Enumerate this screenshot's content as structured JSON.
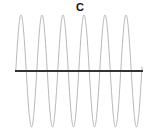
{
  "figure": {
    "label": "C",
    "colors": {
      "wave": "#b8b8b8",
      "baseline": "#333333",
      "label": "#111111"
    }
  },
  "chart_data": {
    "type": "line",
    "title": "C",
    "cycles": 6,
    "wave": {
      "center_y_px": 71,
      "amplitude_px": 56,
      "period_px": 21,
      "start_x_px": 15.75,
      "end_x_px": 142,
      "peaks_x_px": [
        21,
        42,
        63,
        84,
        105,
        126
      ],
      "troughs_x_px": [
        31.5,
        52.5,
        73.5,
        94.5,
        115.5,
        136.5
      ]
    },
    "baseline": {
      "y_px": 71,
      "x_start_px": 15,
      "x_end_px": 143
    },
    "xlabel": "",
    "ylabel": "",
    "grid": false,
    "legend": false
  }
}
